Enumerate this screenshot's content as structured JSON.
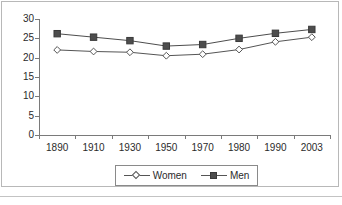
{
  "chart_data": {
    "type": "line",
    "title": "",
    "subtitle": "",
    "xlabel": "",
    "ylabel": "",
    "categories": [
      "1890",
      "1910",
      "1930",
      "1950",
      "1970",
      "1980",
      "1990",
      "2003"
    ],
    "series": [
      {
        "name": "Women",
        "marker": "open-diamond",
        "color": "#555555",
        "values": [
          22.0,
          21.6,
          21.4,
          20.5,
          20.9,
          22.1,
          24.1,
          25.3
        ]
      },
      {
        "name": "Men",
        "marker": "filled-square",
        "color": "#4d4d4d",
        "values": [
          26.2,
          25.3,
          24.4,
          23.0,
          23.4,
          25.0,
          26.3,
          27.3
        ]
      }
    ],
    "ylim": [
      0,
      30
    ],
    "ytick_labels": [
      "0",
      "5",
      "10",
      "15",
      "20",
      "25",
      "30"
    ],
    "ytick_values": [
      0,
      5,
      10,
      15,
      20,
      25,
      30
    ],
    "grid": false,
    "legend_position": "bottom-center",
    "axis_color": "#7a7a7a"
  },
  "legend": {
    "entries": [
      {
        "label": "Women",
        "icon": "open-diamond-marker-icon"
      },
      {
        "label": "Men",
        "icon": "filled-square-marker-icon"
      }
    ]
  }
}
